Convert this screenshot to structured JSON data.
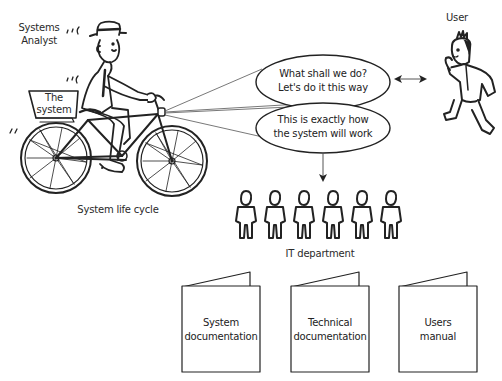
{
  "analyst": {
    "label_line1": "Systems",
    "label_line2": "Analyst",
    "basket_line1": "The",
    "basket_line2": "system",
    "caption": "System life cycle"
  },
  "bubbles": [
    {
      "line1": "What shall we do?",
      "line2": "Let's do it this way"
    },
    {
      "line1": "This is exactly how",
      "line2": "the system will work"
    }
  ],
  "user": {
    "label": "User"
  },
  "it_department": {
    "label": "IT department",
    "people_count": 6
  },
  "documents": [
    {
      "line1": "System",
      "line2": "documentation"
    },
    {
      "line1": "Technical",
      "line2": "documentation"
    },
    {
      "line1": "Users",
      "line2": "manual"
    }
  ],
  "colors": {
    "line": "#222222",
    "background": "#ffffff"
  }
}
